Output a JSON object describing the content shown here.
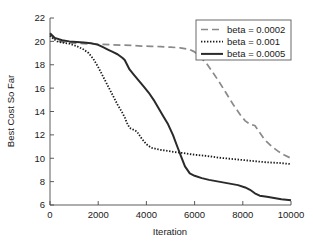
{
  "chart_data": {
    "type": "line",
    "title": "",
    "xlabel": "Iteration",
    "ylabel": "Best Cost So Far",
    "xlim": [
      0,
      10000
    ],
    "ylim": [
      6,
      22
    ],
    "xticks": [
      0,
      2000,
      4000,
      6000,
      8000,
      10000
    ],
    "xtick_labels": [
      "0",
      "2000",
      "4000",
      "6000",
      "8000",
      "10000"
    ],
    "yticks": [
      6,
      8,
      10,
      12,
      14,
      16,
      18,
      20,
      22
    ],
    "ytick_labels": [
      "6",
      "8",
      "10",
      "12",
      "14",
      "16",
      "18",
      "20",
      "22"
    ],
    "grid": false,
    "legend_position": "top-right",
    "series": [
      {
        "name": "beta = 0.0002",
        "style": "dashed",
        "color": "#8a8a8a",
        "x": [
          0,
          200,
          400,
          700,
          1000,
          1400,
          1800,
          2200,
          2600,
          3000,
          3400,
          3800,
          4200,
          4600,
          5000,
          5400,
          5800,
          6000,
          6200,
          6500,
          6800,
          7000,
          7300,
          7600,
          7900,
          8100,
          8300,
          8500,
          8700,
          8900,
          9100,
          9300,
          9500,
          9700,
          10000
        ],
        "y": [
          20.6,
          20.2,
          20.0,
          19.9,
          19.85,
          19.8,
          19.78,
          19.75,
          19.7,
          19.68,
          19.65,
          19.6,
          19.58,
          19.55,
          19.5,
          19.45,
          19.3,
          19.1,
          18.7,
          18.1,
          17.2,
          16.6,
          15.6,
          14.6,
          13.7,
          13.2,
          12.9,
          12.8,
          12.2,
          11.6,
          11.2,
          10.85,
          10.55,
          10.3,
          10.0
        ]
      },
      {
        "name": "beta = 0.001",
        "style": "dotted",
        "color": "#1a1a1a",
        "x": [
          0,
          150,
          300,
          500,
          800,
          1100,
          1400,
          1600,
          1800,
          2000,
          2200,
          2400,
          2600,
          2800,
          3000,
          3100,
          3200,
          3300,
          3400,
          3600,
          3800,
          4000,
          4200,
          4500,
          4800,
          5100,
          5500,
          6000,
          6500,
          7000,
          7500,
          8000,
          8500,
          9000,
          9500,
          10000
        ],
        "y": [
          20.5,
          20.2,
          20.0,
          19.9,
          19.8,
          19.6,
          19.3,
          19.0,
          18.5,
          17.8,
          17.0,
          16.2,
          15.4,
          14.6,
          13.9,
          13.5,
          13.0,
          12.6,
          12.5,
          12.3,
          11.7,
          11.2,
          10.9,
          10.75,
          10.65,
          10.55,
          10.45,
          10.3,
          10.2,
          10.05,
          9.95,
          9.85,
          9.75,
          9.65,
          9.6,
          9.5
        ]
      },
      {
        "name": "beta = 0.0005",
        "style": "solid",
        "color": "#2a2a2a",
        "x": [
          0,
          200,
          500,
          800,
          1100,
          1400,
          1700,
          2000,
          2200,
          2400,
          2600,
          2800,
          3000,
          3100,
          3200,
          3300,
          3500,
          3700,
          3900,
          4100,
          4300,
          4500,
          4700,
          4900,
          5100,
          5300,
          5450,
          5600,
          5800,
          6000,
          6300,
          6600,
          7000,
          7400,
          7800,
          8100,
          8300,
          8500,
          8700,
          9000,
          9300,
          9600,
          10000
        ],
        "y": [
          20.7,
          20.3,
          20.1,
          20.0,
          19.95,
          19.9,
          19.85,
          19.7,
          19.5,
          19.3,
          19.1,
          18.9,
          18.6,
          18.4,
          18.0,
          17.6,
          17.1,
          16.6,
          16.1,
          15.6,
          15.0,
          14.3,
          13.6,
          12.9,
          12.0,
          10.9,
          10.1,
          9.3,
          8.7,
          8.5,
          8.3,
          8.15,
          8.0,
          7.85,
          7.7,
          7.5,
          7.3,
          7.0,
          6.8,
          6.7,
          6.6,
          6.5,
          6.4
        ]
      }
    ]
  },
  "legend": {
    "entries": [
      {
        "label": "beta = 0.0002"
      },
      {
        "label": "beta = 0.001"
      },
      {
        "label": "beta = 0.0005"
      }
    ]
  }
}
